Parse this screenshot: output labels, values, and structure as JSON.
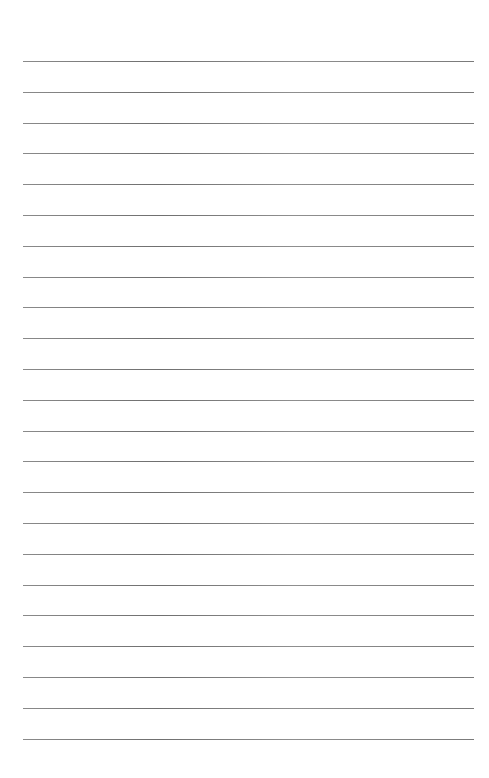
{
  "page": {
    "type": "lined-paper",
    "background_color": "#ffffff",
    "rule_color": "#7a7a7a",
    "rule_count": 23,
    "first_rule_y": 61,
    "rule_spacing": 30.8,
    "rule_left": 23,
    "rule_right": 474
  }
}
